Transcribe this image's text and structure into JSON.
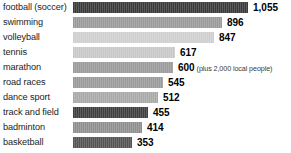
{
  "chart_data": {
    "type": "bar",
    "title": "",
    "subtitle": "",
    "xlabel": "",
    "ylabel": "",
    "orientation": "horizontal",
    "grid": false,
    "legend": "none",
    "xlim": [
      0,
      1055
    ],
    "categories": [
      "football (soccer)",
      "swimming",
      "volleyball",
      "tennis",
      "marathon",
      "road races",
      "dance sport",
      "track and field",
      "badminton",
      "basketball"
    ],
    "values": [
      1055,
      896,
      847,
      617,
      600,
      545,
      512,
      455,
      414,
      353
    ],
    "value_labels": [
      "1,055",
      "896",
      "847",
      "617",
      "600",
      "545",
      "512",
      "455",
      "414",
      "353"
    ],
    "annotations": [
      {
        "category": "marathon",
        "text": "(plus 2,000 local people)"
      }
    ],
    "bar_colors": [
      "#3b3b3b",
      "#9a9a9a",
      "#cfcfcf",
      "#c8c8c8",
      "#9b9b9b",
      "#9a9a9a",
      "#a9a9a9",
      "#3f3f3f",
      "#8f8f8f",
      "#545454"
    ],
    "bars": [
      {
        "label": "football (soccer)",
        "value": 1055,
        "value_label": "1,055",
        "color": "#3b3b3b",
        "note": ""
      },
      {
        "label": "swimming",
        "value": 896,
        "value_label": "896",
        "color": "#9a9a9a",
        "note": ""
      },
      {
        "label": "volleyball",
        "value": 847,
        "value_label": "847",
        "color": "#cfcfcf",
        "note": ""
      },
      {
        "label": "tennis",
        "value": 617,
        "value_label": "617",
        "color": "#c8c8c8",
        "note": ""
      },
      {
        "label": "marathon",
        "value": 600,
        "value_label": "600",
        "color": "#9b9b9b",
        "note": "(plus 2,000 local people)"
      },
      {
        "label": "road races",
        "value": 545,
        "value_label": "545",
        "color": "#9a9a9a",
        "note": ""
      },
      {
        "label": "dance sport",
        "value": 512,
        "value_label": "512",
        "color": "#a9a9a9",
        "note": ""
      },
      {
        "label": "track and field",
        "value": 455,
        "value_label": "455",
        "color": "#3f3f3f",
        "note": ""
      },
      {
        "label": "badminton",
        "value": 414,
        "value_label": "414",
        "color": "#8f8f8f",
        "note": ""
      },
      {
        "label": "basketball",
        "value": 353,
        "value_label": "353",
        "color": "#545454",
        "note": ""
      }
    ]
  },
  "layout": {
    "bar_origin_x": 73,
    "px_per_unit": 0.1659,
    "value_gap": 5,
    "row_height": 15
  }
}
